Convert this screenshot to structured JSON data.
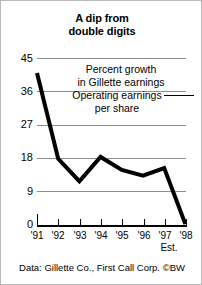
{
  "chart_data": {
    "type": "line",
    "title": "A dip from double digits",
    "xlabel": "",
    "ylabel": "",
    "categories": [
      "'91",
      "'92",
      "'93",
      "'94",
      "'95",
      "'96",
      "'97",
      "'98"
    ],
    "values": [
      41,
      18,
      12,
      18.5,
      15,
      13.5,
      15.5,
      0.5
    ],
    "series": [
      {
        "name": "Percent growth in Gillette earnings",
        "values": [
          41,
          18,
          12,
          18.5,
          15,
          13.5,
          15.5,
          0.5
        ]
      }
    ],
    "ylim": [
      0,
      45
    ],
    "yticks": [
      0,
      9,
      18,
      27,
      36,
      45
    ],
    "ytick_labels": [
      "0",
      "9",
      "18",
      "27",
      "36",
      "45"
    ],
    "grid": true,
    "legend_position": "none",
    "annotations": [
      "Percent growth\nin Gillette earnings",
      "Operating earnings\nper share"
    ],
    "line_color": "#000000",
    "grid_color": "#8d8d8d"
  },
  "title": {
    "line1": "A dip from",
    "line2": "double digits"
  },
  "axes": {
    "y_labels": [
      "45",
      "36",
      "27",
      "18",
      "9",
      "0"
    ],
    "x_labels": [
      "'91",
      "'92",
      "'93",
      "'94",
      "'95",
      "'96",
      "'97",
      "'98"
    ],
    "estimate_note": "Est."
  },
  "annotations": {
    "growth_line1": "Percent growth",
    "growth_line2": "in Gillette earnings",
    "operating_line1": "Operating earnings",
    "operating_line2": "per share"
  },
  "footer": {
    "source": "Data: Gillette Co., First Call Corp.  ©BW"
  }
}
